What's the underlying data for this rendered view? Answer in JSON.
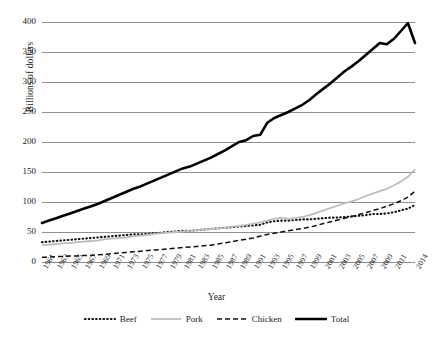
{
  "chart_data": {
    "type": "line",
    "title": "",
    "xlabel": "Year",
    "ylabel": "Billions of dollars",
    "ylim": [
      0,
      400
    ],
    "yticks": [
      0,
      50,
      100,
      150,
      200,
      250,
      300,
      350,
      400
    ],
    "grid": true,
    "legend_position": "bottom",
    "x": [
      1961,
      1962,
      1963,
      1964,
      1965,
      1966,
      1967,
      1968,
      1969,
      1970,
      1971,
      1972,
      1973,
      1974,
      1975,
      1976,
      1977,
      1978,
      1979,
      1980,
      1981,
      1982,
      1983,
      1984,
      1985,
      1986,
      1987,
      1988,
      1989,
      1990,
      1991,
      1992,
      1993,
      1994,
      1995,
      1996,
      1997,
      1998,
      1999,
      2000,
      2001,
      2002,
      2003,
      2004,
      2005,
      2006,
      2007,
      2008,
      2009,
      2010,
      2011,
      2012,
      2013,
      2014
    ],
    "xtick_labels": [
      "1961",
      "1963",
      "1965",
      "1967",
      "1969",
      "1971",
      "1973",
      "1975",
      "1977",
      "1979",
      "1981",
      "1983",
      "1985",
      "1987",
      "1989",
      "1991",
      "1993",
      "1995",
      "1997",
      "1999",
      "2001",
      "2003",
      "2005",
      "2007",
      "2009",
      "2011",
      "2014"
    ],
    "series": [
      {
        "name": "Beef",
        "style": "dotted",
        "color": "#111111",
        "values": [
          33,
          34,
          35,
          36,
          37,
          38,
          39,
          40,
          41,
          42,
          43,
          44,
          45,
          46,
          46,
          47,
          48,
          49,
          50,
          51,
          52,
          52,
          53,
          54,
          55,
          56,
          57,
          58,
          59,
          60,
          61,
          62,
          66,
          68,
          69,
          69,
          70,
          71,
          71,
          72,
          73,
          74,
          74,
          75,
          76,
          77,
          78,
          80,
          80,
          81,
          83,
          86,
          89,
          95
        ]
      },
      {
        "name": "Pork",
        "style": "solid-light",
        "color": "#bdbdbd",
        "values": [
          28,
          29,
          30,
          31,
          32,
          33,
          34,
          35,
          36,
          38,
          39,
          40,
          41,
          43,
          44,
          45,
          47,
          48,
          49,
          50,
          51,
          52,
          53,
          54,
          55,
          56,
          57,
          59,
          60,
          62,
          64,
          66,
          69,
          72,
          74,
          72,
          73,
          75,
          78,
          82,
          86,
          90,
          94,
          98,
          101,
          105,
          110,
          114,
          118,
          122,
          128,
          134,
          142,
          155
        ]
      },
      {
        "name": "Chicken",
        "style": "dashed",
        "color": "#111111",
        "values": [
          8,
          8,
          9,
          9,
          10,
          10,
          11,
          11,
          12,
          13,
          14,
          15,
          16,
          17,
          18,
          19,
          20,
          21,
          22,
          23,
          24,
          25,
          26,
          27,
          28,
          30,
          32,
          34,
          36,
          38,
          40,
          43,
          46,
          48,
          50,
          52,
          54,
          56,
          58,
          61,
          64,
          67,
          70,
          73,
          76,
          79,
          82,
          86,
          89,
          93,
          97,
          102,
          108,
          118
        ]
      },
      {
        "name": "Total",
        "style": "thick",
        "color": "#000000",
        "values": [
          65,
          69,
          73,
          77,
          81,
          85,
          89,
          93,
          97,
          102,
          107,
          112,
          117,
          122,
          126,
          131,
          136,
          141,
          146,
          151,
          156,
          159,
          164,
          169,
          174,
          180,
          186,
          193,
          200,
          203,
          210,
          212,
          232,
          240,
          245,
          250,
          256,
          262,
          270,
          280,
          289,
          298,
          308,
          318,
          326,
          335,
          345,
          355,
          365,
          363,
          372,
          385,
          398,
          365
        ]
      }
    ]
  },
  "axis": {
    "ylabel": "Billions of dollars",
    "xlabel": "Year"
  },
  "legend": {
    "items": [
      {
        "label": "Beef"
      },
      {
        "label": "Pork"
      },
      {
        "label": "Chicken"
      },
      {
        "label": "Total"
      }
    ]
  }
}
